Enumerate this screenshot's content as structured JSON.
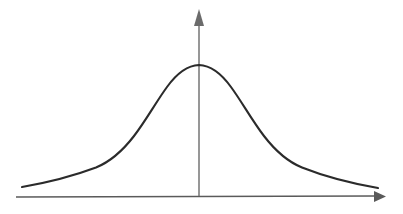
{
  "figure": {
    "kind": "line-plot",
    "background_color": "#ffffff",
    "width": 403,
    "height": 214,
    "title": "",
    "has_tick_labels": false,
    "has_axis_labels": false,
    "has_legend": false,
    "has_gridlines": false
  },
  "axes": {
    "x_axis": {
      "name": "horizontal-axis",
      "color": "#5a5a5a",
      "stroke_width": 1.4,
      "start_x": 16,
      "start_y": 197,
      "end_x": 374,
      "end_y": 196,
      "arrowhead": "right",
      "arrow_points": "374,191 386,196.5 374,202"
    },
    "y_axis": {
      "name": "vertical-axis",
      "color": "#6b6b6b",
      "stroke_width": 1.4,
      "start_x": 199,
      "start_y": 196,
      "end_x": 199,
      "end_y": 24,
      "arrowhead": "up",
      "arrow_points": "194,26 199,9 204,26"
    }
  },
  "curve": {
    "name": "bell-curve",
    "color": "#2b2b2b",
    "stroke_width": 2.1,
    "peak_x": 199,
    "peak_y": 65,
    "left_tail_x": 22,
    "left_tail_y": 187,
    "right_tail_x": 378,
    "right_tail_y": 188,
    "path": "M 22 187 C 48 182.5 72 176.5 96 167.5 C 112 161 124 149 134 136 C 146 120.5 156 102 167 87 C 176 74.5 187 65.5 199 65 C 211 65.5 222 74.5 231 87 C 242 102 252 120.5 264 136 C 274 149 286 161 302 167.5 C 326 177 352 183.5 378 188"
  },
  "chart_data": {
    "type": "line",
    "title": "",
    "xlabel": "",
    "ylabel": "",
    "xlim": [
      -4,
      4
    ],
    "ylim": [
      0,
      1.15
    ],
    "grid": false,
    "legend": false,
    "series": [
      {
        "name": "density",
        "x": [
          -4.0,
          -3.5,
          -3.0,
          -2.6,
          -2.2,
          -1.8,
          -1.5,
          -1.2,
          -0.9,
          -0.6,
          -0.3,
          0.0,
          0.3,
          0.6,
          0.9,
          1.2,
          1.5,
          1.8,
          2.2,
          2.6,
          3.0,
          3.5,
          4.0
        ],
        "y": [
          0.07,
          0.09,
          0.12,
          0.15,
          0.2,
          0.29,
          0.38,
          0.52,
          0.67,
          0.82,
          0.95,
          1.0,
          0.95,
          0.82,
          0.67,
          0.52,
          0.38,
          0.29,
          0.2,
          0.15,
          0.12,
          0.09,
          0.07
        ]
      }
    ],
    "annotations": []
  }
}
